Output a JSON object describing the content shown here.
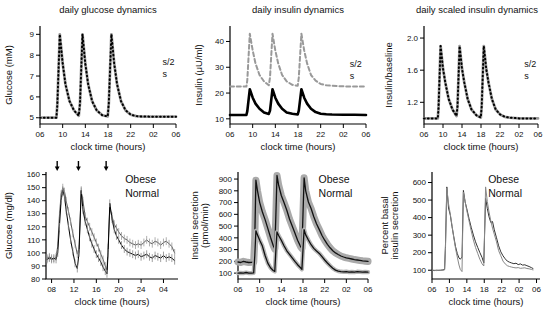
{
  "chart_data": [
    {
      "id": "daily-glucose-dynamics",
      "type": "line",
      "title": "daily glucose dynamics",
      "xlabel": "clock time (hours)",
      "ylabel": "Glucose (mM)",
      "xlim": [
        6,
        30
      ],
      "ylim": [
        4.7,
        9.4
      ],
      "xticks": [
        [
          6,
          "06"
        ],
        [
          10,
          "10"
        ],
        [
          14,
          "14"
        ],
        [
          18,
          "18"
        ],
        [
          22,
          "22"
        ],
        [
          26,
          "02"
        ],
        [
          30,
          "06"
        ]
      ],
      "yticks": [
        [
          5,
          "5"
        ],
        [
          6,
          "6"
        ],
        [
          7,
          "7"
        ],
        [
          8,
          "8"
        ],
        [
          9,
          "9"
        ]
      ],
      "grid": false,
      "x": [
        6,
        8.9,
        9.05,
        9.5,
        10,
        10.5,
        11.2,
        12,
        12.85,
        13.05,
        13.5,
        14,
        14.5,
        15.2,
        16,
        17,
        17.95,
        18.15,
        18.6,
        19.1,
        19.6,
        20.3,
        21.1,
        22,
        23,
        24,
        26,
        28,
        30
      ],
      "series": [
        {
          "name": "s/2",
          "color": "#9a9a9a",
          "width": 2.8,
          "y": [
            5,
            5,
            5.6,
            9,
            7.6,
            6.6,
            5.8,
            5.35,
            5.1,
            5.7,
            9,
            7.6,
            6.6,
            5.8,
            5.35,
            5.12,
            5.06,
            5.7,
            9,
            7.6,
            6.6,
            5.8,
            5.35,
            5.15,
            5.08,
            5.06,
            5.05,
            5.05,
            5.05
          ]
        },
        {
          "name": "s",
          "color": "#000000",
          "width": 2,
          "dash": "0.7,3.2",
          "y_same_as": 0
        }
      ]
    },
    {
      "id": "daily-insulin-dynamics",
      "type": "line",
      "title": "daily insulin dynamics",
      "xlabel": "clock time (hours)",
      "ylabel": "Insulin (μU/ml)",
      "xlim": [
        6,
        30
      ],
      "ylim": [
        8,
        46
      ],
      "xticks": [
        [
          6,
          "06"
        ],
        [
          10,
          "10"
        ],
        [
          14,
          "14"
        ],
        [
          18,
          "18"
        ],
        [
          22,
          "22"
        ],
        [
          26,
          "02"
        ],
        [
          30,
          "06"
        ]
      ],
      "yticks": [
        [
          10,
          "10"
        ],
        [
          20,
          "20"
        ],
        [
          30,
          "30"
        ],
        [
          40,
          "40"
        ]
      ],
      "grid": false,
      "x": [
        6,
        8.9,
        9.05,
        9.5,
        10,
        10.5,
        11.2,
        12,
        12.85,
        13.05,
        13.5,
        14,
        14.5,
        15.2,
        16,
        17,
        17.95,
        18.15,
        18.6,
        19.1,
        19.6,
        20.3,
        21.1,
        22,
        23,
        24,
        26,
        28,
        30
      ],
      "series": [
        {
          "name": "s/2",
          "color": "#999999",
          "width": 2,
          "dash": "4,2.8",
          "y": [
            22.5,
            22.5,
            25,
            43,
            36.5,
            31.5,
            27,
            24.5,
            23,
            26,
            43,
            36.5,
            31.5,
            27,
            24.5,
            23.2,
            22.8,
            26,
            43,
            36.5,
            31.5,
            27,
            24.8,
            23.5,
            23,
            22.8,
            22.6,
            22.5,
            22.5
          ]
        },
        {
          "name": "s",
          "color": "#000000",
          "width": 2.6,
          "y": [
            11.5,
            11.5,
            13,
            21.5,
            18.2,
            15.9,
            13.9,
            12.5,
            11.9,
            13.2,
            21.5,
            18.2,
            15.9,
            13.9,
            12.5,
            11.95,
            11.7,
            13.2,
            21.5,
            18.2,
            15.9,
            13.9,
            12.6,
            12,
            11.8,
            11.7,
            11.6,
            11.55,
            11.5
          ]
        }
      ]
    },
    {
      "id": "daily-scaled-insulin-dynamics",
      "type": "line",
      "title": "daily scaled insulin dynamics",
      "xlabel": "clock time (hours)",
      "ylabel": "Insulin/baseline",
      "xlim": [
        6,
        30
      ],
      "ylim": [
        0.93,
        2.15
      ],
      "xticks": [
        [
          6,
          "06"
        ],
        [
          10,
          "10"
        ],
        [
          14,
          "14"
        ],
        [
          18,
          "18"
        ],
        [
          22,
          "22"
        ],
        [
          26,
          "02"
        ],
        [
          30,
          "06"
        ]
      ],
      "yticks": [
        [
          1.2,
          "1.2"
        ],
        [
          1.6,
          "1.6"
        ],
        [
          2.0,
          "2.0"
        ]
      ],
      "grid": false,
      "x": [
        6,
        8.9,
        9.05,
        9.5,
        10,
        10.5,
        11.2,
        12,
        12.85,
        13.05,
        13.5,
        14,
        14.5,
        15.2,
        16,
        17,
        17.95,
        18.15,
        18.6,
        19.1,
        19.6,
        20.3,
        21.1,
        22,
        23,
        24,
        26,
        28,
        30
      ],
      "series": [
        {
          "name": "s/2",
          "color": "#9a9a9a",
          "width": 2.8,
          "y": [
            1,
            1,
            1.12,
            1.9,
            1.62,
            1.44,
            1.24,
            1.11,
            1.03,
            1.15,
            1.9,
            1.62,
            1.44,
            1.24,
            1.11,
            1.04,
            1.01,
            1.15,
            1.9,
            1.62,
            1.44,
            1.24,
            1.11,
            1.05,
            1.02,
            1.01,
            1,
            1,
            1
          ]
        },
        {
          "name": "s",
          "color": "#000000",
          "width": 2,
          "dash": "0.7,3.2",
          "y_same_as": 0
        }
      ]
    },
    {
      "id": "glucose-mgdl-obese-normal",
      "type": "line",
      "title": "",
      "xlabel": "clock time (hours)",
      "ylabel": "Glucose (mg/dl)",
      "xlim": [
        7,
        30.6
      ],
      "ylim": [
        80,
        162
      ],
      "xticks": [
        [
          8,
          "08"
        ],
        [
          12,
          "12"
        ],
        [
          16,
          "16"
        ],
        [
          20,
          "20"
        ],
        [
          24,
          "24"
        ],
        [
          28,
          "04"
        ]
      ],
      "yticks": [
        [
          80,
          "80"
        ],
        [
          90,
          "90"
        ],
        [
          100,
          "100"
        ],
        [
          110,
          "110"
        ],
        [
          120,
          "120"
        ],
        [
          130,
          "130"
        ],
        [
          140,
          "140"
        ],
        [
          150,
          "150"
        ],
        [
          160,
          "160"
        ]
      ],
      "grid": false,
      "arrows": [
        9,
        12.8,
        17.75
      ],
      "x": [
        7.2,
        7.6,
        8,
        8.4,
        8.8,
        9.1,
        9.4,
        9.7,
        10,
        10.3,
        10.6,
        11,
        11.4,
        11.8,
        12.2,
        12.6,
        12.9,
        13.3,
        13.6,
        14,
        14.4,
        14.8,
        15.2,
        15.6,
        16,
        16.4,
        16.8,
        17.2,
        17.6,
        17.9,
        18.1,
        18.4,
        18.8,
        19.2,
        19.6,
        20,
        20.5,
        21,
        21.5,
        22,
        22.5,
        23,
        23.5,
        24,
        24.5,
        25,
        25.5,
        26,
        26.5,
        27,
        27.5,
        28,
        28.5,
        29,
        29.5,
        30
      ],
      "series": [
        {
          "name": "Obese",
          "color": "#555555",
          "width": 1,
          "error": 3,
          "error_color": "#9a9a9a",
          "y": [
            96,
            97,
            96,
            95,
            97,
            105,
            128,
            145,
            150,
            147,
            140,
            132,
            124,
            115,
            107,
            99,
            103,
            147,
            140,
            128,
            124,
            120,
            116,
            112,
            108,
            104,
            99,
            95,
            90,
            87,
            104,
            135,
            128,
            122,
            119,
            116,
            113,
            111,
            110,
            108,
            107,
            106,
            107,
            106,
            108,
            110,
            108,
            107,
            109,
            108,
            106,
            108,
            109,
            107,
            105,
            100
          ]
        },
        {
          "name": "Normal",
          "color": "#000000",
          "width": 1,
          "error": 3,
          "error_color": "#888888",
          "y": [
            95,
            96,
            95,
            96,
            95,
            100,
            120,
            140,
            148,
            143,
            133,
            121,
            110,
            101,
            92,
            88,
            100,
            148,
            133,
            124,
            118,
            112,
            107,
            103,
            99,
            96,
            93,
            89,
            86,
            84,
            100,
            138,
            126,
            118,
            113,
            110,
            106,
            103,
            101,
            100,
            99,
            98,
            99,
            97,
            98,
            99,
            97,
            96,
            98,
            97,
            96,
            98,
            96,
            97,
            96,
            94
          ]
        }
      ]
    },
    {
      "id": "insulin-secretion-obese-normal",
      "type": "line",
      "title": "",
      "xlabel": "clock time (hours)",
      "ylabel": "Insulin secretion\n(pmol/min)",
      "xlim": [
        6,
        30
      ],
      "ylim": [
        50,
        960
      ],
      "xticks": [
        [
          6,
          "06"
        ],
        [
          10,
          "10"
        ],
        [
          14,
          "14"
        ],
        [
          18,
          "18"
        ],
        [
          22,
          "22"
        ],
        [
          26,
          "02"
        ],
        [
          30,
          "06"
        ]
      ],
      "yticks": [
        [
          100,
          "100"
        ],
        [
          200,
          "200"
        ],
        [
          300,
          "300"
        ],
        [
          400,
          "400"
        ],
        [
          500,
          "500"
        ],
        [
          600,
          "600"
        ],
        [
          700,
          "700"
        ],
        [
          800,
          "800"
        ],
        [
          900,
          "900"
        ]
      ],
      "grid": false,
      "x": [
        6,
        6.5,
        7,
        7.5,
        8,
        8.5,
        8.9,
        9.1,
        9.3,
        9.6,
        10,
        10.5,
        11,
        11.5,
        12,
        12.5,
        12.8,
        13,
        13.2,
        13.5,
        14,
        14.5,
        15,
        15.5,
        16,
        16.5,
        17,
        17.5,
        17.8,
        18,
        18.2,
        18.5,
        19,
        19.5,
        20,
        20.5,
        21,
        21.5,
        22,
        22.5,
        23,
        23.5,
        24,
        24.5,
        25,
        25.5,
        26,
        26.5,
        27,
        27.5,
        28,
        28.5,
        29,
        29.5,
        30
      ],
      "series": [
        {
          "name": "Obese",
          "color": "#111111",
          "width": 1.3,
          "band": 30,
          "band_color": "#aaaaaa",
          "y": [
            195,
            190,
            200,
            195,
            190,
            192,
            195,
            400,
            890,
            800,
            700,
            620,
            555,
            480,
            405,
            335,
            305,
            600,
            930,
            850,
            760,
            700,
            635,
            560,
            500,
            440,
            380,
            330,
            310,
            600,
            910,
            800,
            705,
            650,
            580,
            520,
            470,
            420,
            380,
            345,
            315,
            290,
            272,
            258,
            246,
            237,
            230,
            225,
            220,
            215,
            212,
            208,
            205,
            202,
            200
          ]
        },
        {
          "name": "Normal",
          "color": "#111111",
          "width": 1.3,
          "band": 18,
          "band_color": "#b5b5b5",
          "y": [
            100,
            102,
            100,
            105,
            100,
            100,
            102,
            250,
            460,
            425,
            380,
            330,
            250,
            185,
            145,
            122,
            115,
            300,
            450,
            420,
            380,
            332,
            290,
            260,
            230,
            200,
            172,
            148,
            132,
            300,
            470,
            425,
            382,
            342,
            310,
            288,
            268,
            240,
            212,
            186,
            162,
            142,
            126,
            117,
            112,
            110,
            112,
            109,
            110,
            108,
            112,
            110,
            108,
            110,
            108
          ]
        }
      ]
    },
    {
      "id": "percent-basal-insulin-secretion",
      "type": "line",
      "title": "",
      "xlabel": "clock time (hours)",
      "ylabel": "Percent basal\ninsulin secretion",
      "xlim": [
        6,
        30.8
      ],
      "ylim": [
        50,
        660
      ],
      "xticks": [
        [
          6,
          "06"
        ],
        [
          10,
          "10"
        ],
        [
          14,
          "14"
        ],
        [
          18,
          "18"
        ],
        [
          22,
          "22"
        ],
        [
          26,
          "02"
        ],
        [
          30,
          "06"
        ]
      ],
      "yticks": [
        [
          100,
          "100"
        ],
        [
          200,
          "200"
        ],
        [
          300,
          "300"
        ],
        [
          400,
          "400"
        ],
        [
          500,
          "500"
        ],
        [
          600,
          "600"
        ]
      ],
      "grid": false,
      "x": [
        6,
        6.5,
        7,
        7.5,
        8,
        8.5,
        8.9,
        9.1,
        9.4,
        9.8,
        10.2,
        10.6,
        11,
        11.4,
        11.8,
        12.2,
        12.5,
        12.9,
        13.2,
        13.6,
        14,
        14.5,
        15,
        15.5,
        16,
        16.5,
        17,
        17.5,
        17.9,
        18.3,
        18.7,
        19.1,
        19.5,
        19.9,
        20.3,
        20.8,
        21.3,
        21.8,
        22.3,
        22.8,
        23.3,
        23.8,
        24.3,
        24.8,
        25.3,
        25.8,
        26.3,
        26.8,
        27.3,
        27.8,
        28.3,
        28.8,
        29.2
      ],
      "series": [
        {
          "name": "Obese",
          "color": "#333333",
          "width": 1,
          "y": [
            100,
            98,
            100,
            99,
            100,
            102,
            105,
            250,
            575,
            455,
            415,
            350,
            290,
            235,
            195,
            170,
            163,
            175,
            555,
            490,
            450,
            395,
            345,
            300,
            262,
            230,
            200,
            172,
            142,
            510,
            452,
            405,
            372,
            378,
            330,
            285,
            240,
            205,
            182,
            165,
            152,
            146,
            141,
            137,
            140,
            132,
            136,
            129,
            131,
            126,
            121,
            115,
            110
          ]
        },
        {
          "name": "Normal",
          "color": "#888888",
          "width": 1,
          "y": [
            100,
            100,
            98,
            100,
            99,
            100,
            102,
            230,
            570,
            480,
            420,
            355,
            285,
            225,
            175,
            130,
            105,
            92,
            545,
            492,
            440,
            382,
            325,
            272,
            230,
            196,
            162,
            136,
            124,
            575,
            492,
            432,
            382,
            340,
            305,
            262,
            212,
            182,
            152,
            136,
            126,
            121,
            118,
            115,
            113,
            115,
            111,
            112,
            114,
            110,
            108,
            105,
            102
          ]
        }
      ]
    }
  ]
}
